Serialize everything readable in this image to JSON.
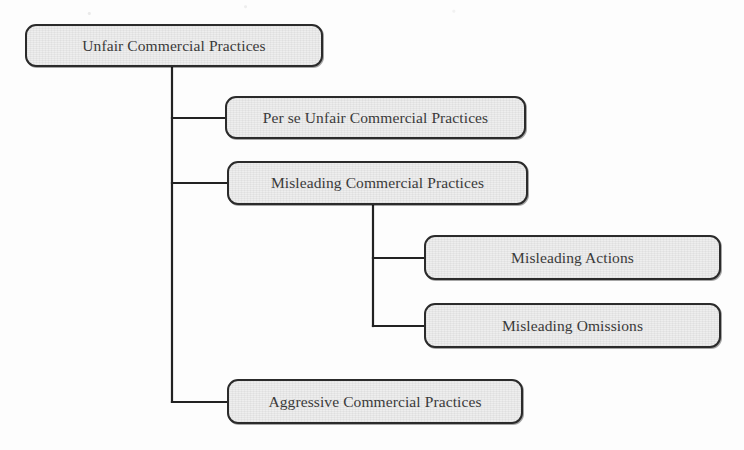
{
  "diagram": {
    "type": "hierarchy-tree",
    "colors": {
      "node_fill": "#eeeeee",
      "node_border": "#2b2b2b",
      "connector": "#222222",
      "text": "#3a3a3a",
      "background": "#fdfdfd"
    },
    "nodes": [
      {
        "id": "root",
        "label": "Unfair Commercial Practices",
        "level": 0,
        "x": 25,
        "y": 24,
        "w": 298,
        "h": 43
      },
      {
        "id": "per-se",
        "label": "Per se Unfair Commercial Practices",
        "level": 1,
        "x": 225,
        "y": 96,
        "w": 301,
        "h": 43
      },
      {
        "id": "misleading",
        "label": "Misleading Commercial Practices",
        "level": 1,
        "x": 227,
        "y": 161,
        "w": 301,
        "h": 44
      },
      {
        "id": "actions",
        "label": "Misleading Actions",
        "level": 2,
        "x": 424,
        "y": 235,
        "w": 297,
        "h": 45
      },
      {
        "id": "omissions",
        "label": "Misleading Omissions",
        "level": 2,
        "x": 424,
        "y": 303,
        "w": 297,
        "h": 45
      },
      {
        "id": "aggressive",
        "label": "Aggressive Commercial Practices",
        "level": 1,
        "x": 227,
        "y": 379,
        "w": 296,
        "h": 45
      }
    ],
    "edges": [
      {
        "from": "root",
        "to": "per-se"
      },
      {
        "from": "root",
        "to": "misleading"
      },
      {
        "from": "root",
        "to": "aggressive"
      },
      {
        "from": "misleading",
        "to": "actions"
      },
      {
        "from": "misleading",
        "to": "omissions"
      }
    ],
    "connector_paths": [
      "M172,67 L172,402",
      "M172,118 L225,118",
      "M172,183 L227,183",
      "M172,402 L227,402",
      "M373,205 L373,326",
      "M373,258 L424,258",
      "M373,326 L424,326"
    ]
  }
}
